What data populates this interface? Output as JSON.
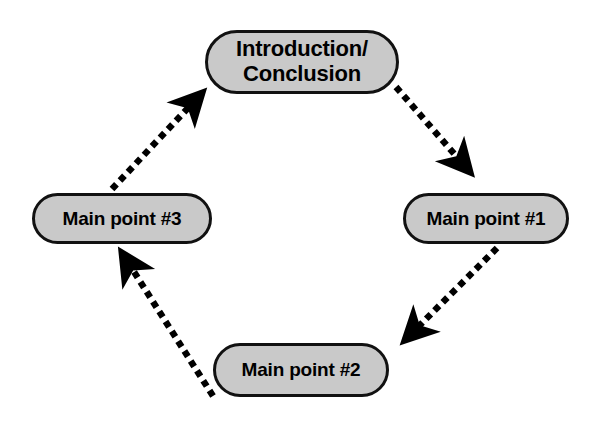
{
  "diagram": {
    "type": "cycle-flow",
    "background_color": "#ffffff",
    "node_fill_color": "#c9c9c9",
    "node_border_color": "#111111",
    "edge_color": "#000000",
    "edge_style": "square-dotted",
    "nodes": [
      {
        "id": "intro",
        "label": "Introduction/\nConclusion",
        "position": "top"
      },
      {
        "id": "mp1",
        "label": "Main point #1",
        "position": "right"
      },
      {
        "id": "mp2",
        "label": "Main point #2",
        "position": "bottom"
      },
      {
        "id": "mp3",
        "label": "Main point #3",
        "position": "left"
      }
    ],
    "edges": [
      {
        "id": "edge-intro-mp1",
        "from": "intro",
        "to": "mp1",
        "direction": "down-right",
        "arrowhead": "end"
      },
      {
        "id": "edge-mp1-mp2",
        "from": "mp1",
        "to": "mp2",
        "direction": "down-left",
        "arrowhead": "end"
      },
      {
        "id": "edge-mp2-mp3",
        "from": "mp2",
        "to": "mp3",
        "direction": "up-left",
        "arrowhead": "end"
      },
      {
        "id": "edge-mp3-intro",
        "from": "mp3",
        "to": "intro",
        "direction": "up-right",
        "arrowhead": "end"
      }
    ]
  }
}
